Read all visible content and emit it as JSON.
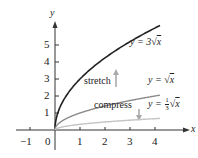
{
  "chart_data": {
    "type": "line",
    "title": "",
    "xlabel": "x",
    "ylabel": "y",
    "xlim": [
      -1.2,
      4.6
    ],
    "ylim": [
      0,
      6.3
    ],
    "x_ticks": [
      "−1",
      "0",
      "1",
      "2",
      "3",
      "4"
    ],
    "y_ticks": [
      "1",
      "2",
      "3",
      "4",
      "5"
    ],
    "grid": false,
    "series": [
      {
        "name": "y = 3√x",
        "function": "3*sqrt(x)",
        "color": "#222222",
        "x": [
          0,
          0.25,
          1,
          2,
          3,
          4,
          4.2
        ],
        "values": [
          0,
          1.5,
          3,
          4.24,
          5.2,
          6,
          6.15
        ]
      },
      {
        "name": "y = √x",
        "function": "sqrt(x)",
        "color": "#8a8a8a",
        "x": [
          0,
          0.25,
          1,
          2,
          3,
          4,
          4.2
        ],
        "values": [
          0,
          0.5,
          1,
          1.41,
          1.73,
          2,
          2.05
        ]
      },
      {
        "name": "y = (1/3)√x",
        "function": "sqrt(x)/3",
        "color": "#c4c4c4",
        "x": [
          0,
          0.25,
          1,
          2,
          3,
          4,
          4.2
        ],
        "values": [
          0,
          0.17,
          0.33,
          0.47,
          0.58,
          0.67,
          0.68
        ]
      }
    ],
    "annotations": [
      "stretch",
      "compress"
    ]
  },
  "labels": {
    "x_axis": "x",
    "y_axis": "y",
    "eq_stretch_prefix": "y = 3",
    "eq_base_prefix": "y = ",
    "eq_compress_prefix": "y = ",
    "eq_compress_num": "1",
    "eq_compress_den": "3",
    "eq_var": "x",
    "stretch": "stretch",
    "compress": "compress"
  },
  "ticks": {
    "x": [
      "−1",
      "0",
      "1",
      "2",
      "3",
      "4"
    ],
    "y": [
      "1",
      "2",
      "3",
      "4",
      "5"
    ]
  }
}
